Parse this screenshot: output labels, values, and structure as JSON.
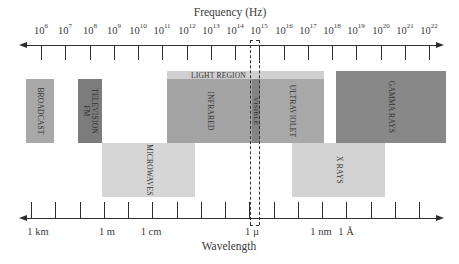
{
  "frequency_axis": {
    "title": "Frequency (Hz)",
    "ticks": [
      {
        "base": "10",
        "exp": "6"
      },
      {
        "base": "10",
        "exp": "7"
      },
      {
        "base": "10",
        "exp": "8"
      },
      {
        "base": "10",
        "exp": "9"
      },
      {
        "base": "10",
        "exp": "10"
      },
      {
        "base": "10",
        "exp": "11"
      },
      {
        "base": "10",
        "exp": "12"
      },
      {
        "base": "10",
        "exp": "13"
      },
      {
        "base": "10",
        "exp": "14"
      },
      {
        "base": "10",
        "exp": "15"
      },
      {
        "base": "10",
        "exp": "16"
      },
      {
        "base": "10",
        "exp": "17"
      },
      {
        "base": "10",
        "exp": "18"
      },
      {
        "base": "10",
        "exp": "19"
      },
      {
        "base": "10",
        "exp": "20"
      },
      {
        "base": "10",
        "exp": "21"
      },
      {
        "base": "10",
        "exp": "22"
      }
    ]
  },
  "wavelength_axis": {
    "title": "Wavelength",
    "labels": [
      {
        "text": "1 km",
        "x": 38
      },
      {
        "text": "1 m",
        "x": 107
      },
      {
        "text": "1 cm",
        "x": 151
      },
      {
        "text": "1 µ",
        "x": 252
      },
      {
        "text": "1 nm",
        "x": 321
      },
      {
        "text": "1 Å",
        "x": 346
      }
    ]
  },
  "bands": {
    "light_region": "LIGHT REGION",
    "broadcast": "BROADCAST",
    "television_fm": [
      "TELEVISION",
      "FM"
    ],
    "microwaves": "MICROWAVES",
    "infrared": "INFRARED",
    "visible": "VISIBLE",
    "ultraviolet": "ULTRAVIOLET",
    "x_rays": "X RAYS",
    "gamma_rays": "GAMMA RAYS"
  },
  "colors": {
    "axis": "#2e2e2e",
    "broadcast": "#a8a8a8",
    "television_fm": "#7c7c7c",
    "microwaves": "#d6d6d6",
    "light_region": "#cfcfcf",
    "infrared": "#a3a3a3",
    "visible": "#848484",
    "ultraviolet": "#a8a8a8",
    "x_rays": "#d3d3d3",
    "gamma_rays": "#888888"
  }
}
